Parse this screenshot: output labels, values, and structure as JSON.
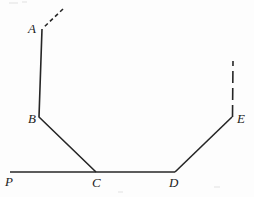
{
  "figure": {
    "canvas": {
      "width": 254,
      "height": 197,
      "background": "#fdfdfd"
    },
    "stroke": {
      "color": "#262626",
      "width": 1.5,
      "dash_pattern": "4 3"
    },
    "labels": [
      {
        "id": "A",
        "text": "A",
        "x": 28,
        "y": 22
      },
      {
        "id": "B",
        "text": "B",
        "x": 28,
        "y": 112
      },
      {
        "id": "P",
        "text": "P",
        "x": 5,
        "y": 175
      },
      {
        "id": "C",
        "text": "C",
        "x": 92,
        "y": 176
      },
      {
        "id": "D",
        "text": "D",
        "x": 169,
        "y": 176
      },
      {
        "id": "E",
        "text": "E",
        "x": 237,
        "y": 112
      }
    ],
    "points": {
      "A": {
        "x": 42,
        "y": 29
      },
      "B": {
        "x": 39,
        "y": 117
      },
      "C": {
        "x": 96,
        "y": 172
      },
      "D": {
        "x": 175,
        "y": 172
      },
      "E": {
        "x": 232,
        "y": 117
      },
      "P": {
        "x": 10,
        "y": 172
      },
      "ray_A_tip": {
        "x": 63,
        "y": 9
      },
      "ray_E_tip": {
        "x": 233,
        "y": 61
      }
    },
    "segments": [
      {
        "name": "ray-from-A",
        "style": "dashed",
        "from": "ray_A_tip",
        "to": "A"
      },
      {
        "name": "segment-A-B",
        "style": "solid",
        "from": "A",
        "to": "B"
      },
      {
        "name": "segment-B-C",
        "style": "solid",
        "from": "B",
        "to": "C"
      },
      {
        "name": "segment-P-C",
        "style": "solid",
        "from": "P",
        "to": "C"
      },
      {
        "name": "segment-C-D",
        "style": "solid",
        "from": "C",
        "to": "D"
      },
      {
        "name": "segment-D-E",
        "style": "solid",
        "from": "D",
        "to": "E"
      },
      {
        "name": "ray-from-E",
        "style": "dashed",
        "from": "E",
        "to": "ray_E_tip"
      }
    ],
    "paths": {
      "baseline": "M 10 172 L 96 172 L 175 172",
      "left_chain": "M 42 29 L 39 117 L 96 172",
      "right_chain": "M 175 172 L 232 117",
      "dash_top_left": "M 63 9 L 43 28",
      "dash_right": "M 232.5 117 L 233 61"
    },
    "specks": [
      {
        "x": 9,
        "y": 2,
        "w": 9,
        "h": 2
      },
      {
        "x": 22,
        "y": 1,
        "w": 5,
        "h": 2
      },
      {
        "x": 214,
        "y": 186,
        "w": 6,
        "h": 2
      },
      {
        "x": 118,
        "y": 191,
        "w": 5,
        "h": 2
      }
    ]
  }
}
